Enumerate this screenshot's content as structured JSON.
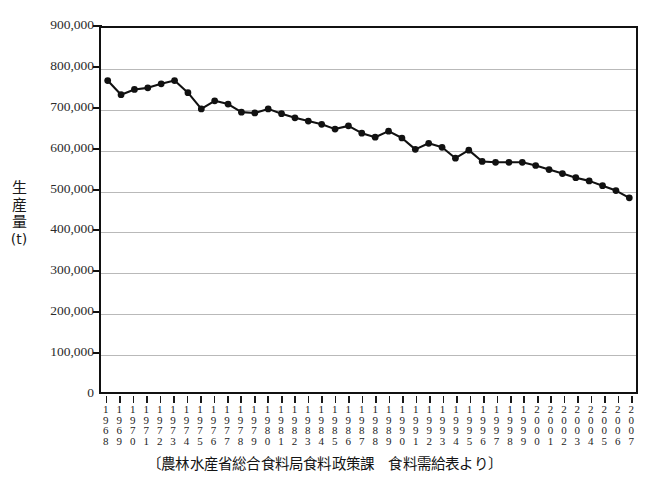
{
  "chart_data": {
    "type": "line",
    "title": "",
    "xlabel": "",
    "ylabel": "生産量 (t)",
    "ylabel_chars": [
      "生",
      "産",
      "量",
      "(t)"
    ],
    "ylim": [
      0,
      900000
    ],
    "ytick_labels": [
      "900,000",
      "800,000",
      "700,000",
      "600,000",
      "500,000",
      "400,000",
      "300,000",
      "200,000",
      "100,000",
      "0"
    ],
    "ytick_values": [
      900000,
      800000,
      700000,
      600000,
      500000,
      400000,
      300000,
      200000,
      100000,
      0
    ],
    "grid": true,
    "legend": "none",
    "marker": "filled-circle",
    "line_color": "#111111",
    "grid_color": "#b9b9b9",
    "axis_color": "#111111",
    "categories": [
      "1968",
      "1969",
      "1970",
      "1971",
      "1972",
      "1973",
      "1974",
      "1975",
      "1976",
      "1977",
      "1978",
      "1979",
      "1980",
      "1981",
      "1982",
      "1983",
      "1984",
      "1985",
      "1986",
      "1987",
      "1988",
      "1989",
      "1990",
      "1991",
      "1992",
      "1993",
      "1994",
      "1995",
      "1996",
      "1997",
      "1998",
      "1999",
      "2000",
      "2001",
      "2002",
      "2003",
      "2004",
      "2005",
      "2006",
      "2007"
    ],
    "values": [
      770000,
      735000,
      748000,
      752000,
      762000,
      770000,
      740000,
      700000,
      720000,
      712000,
      692000,
      690000,
      700000,
      688000,
      678000,
      670000,
      662000,
      650000,
      658000,
      640000,
      630000,
      645000,
      628000,
      600000,
      615000,
      605000,
      578000,
      598000,
      570000,
      568000,
      568000,
      568000,
      560000,
      550000,
      540000,
      530000,
      522000,
      510000,
      498000,
      480000
    ],
    "y_unit": "t"
  },
  "caption": {
    "text": "〔農林水産省総合食料局食料政策課　食料需給表より〕"
  }
}
